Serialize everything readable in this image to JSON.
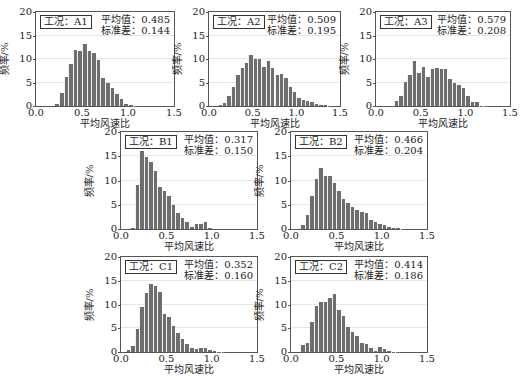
{
  "chart_data": [
    {
      "type": "bar",
      "id": "A1",
      "case_label": "工况：A1",
      "mean_label": "平均值：0.485",
      "std_label": "标准差：0.144",
      "xlabel": "平均风速比",
      "ylabel": "频率/%",
      "xlim": [
        0,
        1.5
      ],
      "ylim": [
        0,
        20
      ],
      "xticks": [
        "0.0",
        "0.5",
        "1.0",
        "1.5"
      ],
      "yticks": [
        "0",
        "5",
        "10",
        "15",
        "20"
      ],
      "bin_width": 0.05,
      "x_start": 0.2,
      "values": [
        0.5,
        2.8,
        6.2,
        9.0,
        12.0,
        11.7,
        13.2,
        11.8,
        11.2,
        9.7,
        6.0,
        4.9,
        3.8,
        2.6,
        1.4,
        0.5,
        0.2,
        0.1
      ]
    },
    {
      "type": "bar",
      "id": "A2",
      "case_label": "工况：A2",
      "mean_label": "平均值：0.509",
      "std_label": "标准差：0.195",
      "xlabel": "平均风速比",
      "ylabel": "频率/%",
      "xlim": [
        0,
        1.5
      ],
      "ylim": [
        0,
        20
      ],
      "xticks": [
        "0.0",
        "0.5",
        "1.0",
        "1.5"
      ],
      "yticks": [
        "0",
        "5",
        "10",
        "15",
        "20"
      ],
      "bin_width": 0.05,
      "x_start": 0.1,
      "values": [
        0.3,
        0.6,
        2.2,
        4.1,
        6.5,
        8.1,
        9.2,
        10.8,
        9.9,
        9.9,
        8.4,
        9.5,
        8.1,
        6.6,
        6.9,
        5.9,
        4.1,
        3.0,
        1.8,
        1.2,
        1.0,
        0.8,
        0.5,
        0.3,
        0.2,
        0.1
      ]
    },
    {
      "type": "bar",
      "id": "A3",
      "case_label": "工况：A3",
      "mean_label": "平均值：0.579",
      "std_label": "标准差：0.208",
      "xlabel": "平均风速比",
      "ylabel": "频率/%",
      "xlim": [
        0,
        1.5
      ],
      "ylim": [
        0,
        20
      ],
      "xticks": [
        "0.0",
        "0.5",
        "1.0",
        "1.5"
      ],
      "yticks": [
        "0",
        "5",
        "10",
        "15",
        "20"
      ],
      "bin_width": 0.05,
      "x_start": 0.2,
      "values": [
        1.0,
        2.2,
        5.2,
        6.6,
        9.5,
        7.0,
        8.4,
        6.2,
        7.8,
        8.1,
        7.8,
        7.8,
        5.8,
        5.0,
        4.4,
        3.8,
        2.1,
        0.8,
        0.8,
        0.1,
        0.1
      ]
    },
    {
      "type": "bar",
      "id": "B1",
      "case_label": "工况：B1",
      "mean_label": "平均值：0.317",
      "std_label": "标准差：0.150",
      "xlabel": "平均风速比",
      "ylabel": "频率/%",
      "xlim": [
        0,
        1.5
      ],
      "ylim": [
        0,
        20
      ],
      "xticks": [
        "0.0",
        "0.5",
        "1.0",
        "1.5"
      ],
      "yticks": [
        "0",
        "5",
        "10",
        "15",
        "20"
      ],
      "bin_width": 0.05,
      "x_start": 0.1,
      "values": [
        0.3,
        9.0,
        16.0,
        14.8,
        13.8,
        12.0,
        8.7,
        7.8,
        6.8,
        5.0,
        3.3,
        2.3,
        1.5,
        0.5,
        1.1,
        1.1,
        1.5,
        0.3
      ]
    },
    {
      "type": "bar",
      "id": "B2",
      "case_label": "工况：B2",
      "mean_label": "平均值：0.466",
      "std_label": "标准差：0.204",
      "xlabel": "平均风速比",
      "ylabel": "频率/%",
      "xlim": [
        0,
        1.5
      ],
      "ylim": [
        0,
        20
      ],
      "xticks": [
        "0.0",
        "0.5",
        "1.0",
        "1.5"
      ],
      "yticks": [
        "0",
        "5",
        "10",
        "15",
        "20"
      ],
      "bin_width": 0.05,
      "x_start": 0.1,
      "values": [
        0.8,
        2.9,
        6.8,
        10.4,
        12.6,
        10.9,
        10.9,
        9.5,
        7.8,
        6.2,
        5.4,
        4.5,
        3.9,
        3.6,
        3.2,
        1.9,
        1.5,
        1.0,
        0.8,
        0.5,
        0.3,
        0.2,
        0.1
      ]
    },
    {
      "type": "bar",
      "id": "C1",
      "case_label": "工况：C1",
      "mean_label": "平均值：0.352",
      "std_label": "标准差：0.160",
      "xlabel": "平均风速比",
      "ylabel": "频率/%",
      "xlim": [
        0,
        1.5
      ],
      "ylim": [
        0,
        20
      ],
      "xticks": [
        "0.0",
        "0.5",
        "1.0",
        "1.5"
      ],
      "yticks": [
        "0",
        "5",
        "10",
        "15",
        "20"
      ],
      "bin_width": 0.05,
      "x_start": 0.05,
      "values": [
        0.4,
        1.3,
        4.9,
        9.4,
        12.5,
        14.4,
        13.8,
        12.6,
        7.9,
        7.4,
        5.5,
        4.0,
        2.8,
        1.6,
        0.9,
        0.6,
        0.9,
        0.9,
        0.4,
        0.2,
        0.1,
        0.1
      ]
    },
    {
      "type": "bar",
      "id": "C2",
      "case_label": "工况：C2",
      "mean_label": "平均值：0.414",
      "std_label": "标准差：0.186",
      "xlabel": "平均风速比",
      "ylabel": "频率/%",
      "xlim": [
        0,
        1.5
      ],
      "ylim": [
        0,
        20
      ],
      "xticks": [
        "0.0",
        "0.5",
        "1.0",
        "1.5"
      ],
      "yticks": [
        "0",
        "5",
        "10",
        "15",
        "20"
      ],
      "bin_width": 0.05,
      "x_start": 0.1,
      "values": [
        1.4,
        1.9,
        6.4,
        9.7,
        10.5,
        10.5,
        11.3,
        12.3,
        8.8,
        7.5,
        5.2,
        4.2,
        3.3,
        2.0,
        1.6,
        0.8,
        0.3,
        1.0,
        0.6,
        0.3,
        0.1,
        0.1
      ]
    }
  ],
  "colors": {
    "bar": "#6e6e6e",
    "frame": "#555555",
    "grid": "#e6e6e6"
  }
}
